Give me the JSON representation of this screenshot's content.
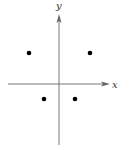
{
  "diagram": {
    "type": "coordinate-plane",
    "axes": {
      "x_label": "x",
      "y_label": "y",
      "color": "#666666"
    },
    "points": [
      {
        "name": "upper-left",
        "quadrant": "II",
        "cx": 29,
        "cy": 53
      },
      {
        "name": "upper-right",
        "quadrant": "I",
        "cx": 90,
        "cy": 53
      },
      {
        "name": "lower-left",
        "quadrant": "III",
        "cx": 44,
        "cy": 99
      },
      {
        "name": "lower-right",
        "quadrant": "IV",
        "cx": 75,
        "cy": 99
      }
    ],
    "point_color": "#000000"
  }
}
